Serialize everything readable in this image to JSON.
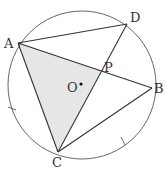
{
  "diagram": {
    "type": "geometry",
    "circle": {
      "center_label": "O",
      "cx": 82,
      "cy": 85,
      "r": 74
    },
    "points": {
      "A": {
        "label": "A",
        "x": 18,
        "y": 43
      },
      "D": {
        "label": "D",
        "x": 127,
        "y": 24
      },
      "B": {
        "label": "B",
        "x": 152,
        "y": 88
      },
      "C": {
        "label": "C",
        "x": 58,
        "y": 152
      },
      "P": {
        "label": "P",
        "x": 101,
        "y": 71
      },
      "O": {
        "label": "O",
        "x": 81,
        "y": 84
      }
    },
    "segments": [
      "AD",
      "AB",
      "AC",
      "DC",
      "CB"
    ],
    "shaded_region": "triangle APC",
    "equal_arc_marks": [
      "arc AC",
      "arc CB"
    ],
    "colors": {
      "stroke": "#333333",
      "shade": "#e6e6e6",
      "background": "#ffffff"
    }
  }
}
